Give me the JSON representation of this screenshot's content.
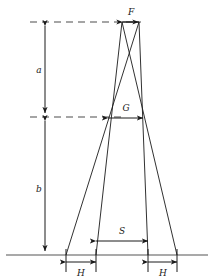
{
  "figure": {
    "background_color": "#ffffff",
    "line_color": "#1a1a1a",
    "ground_color": "#8c8c8c",
    "dashed_color": "#4d4d4d",
    "width": 214,
    "height": 280
  },
  "dimensions": {
    "a": {
      "label": "a",
      "orientation": "vertical",
      "description": "vertical distance from top dashed line to middle dashed line"
    },
    "b": {
      "label": "b",
      "orientation": "vertical",
      "description": "vertical distance from middle dashed line to ground line"
    },
    "F": {
      "label": "F",
      "orientation": "horizontal",
      "description": "width at top apex"
    },
    "G": {
      "label": "G",
      "orientation": "horizontal",
      "description": "width at middle dashed line"
    },
    "S": {
      "label": "S",
      "orientation": "horizontal",
      "description": "inner track spacing at ground level"
    },
    "H_left": {
      "label": "H",
      "orientation": "horizontal",
      "description": "left contact patch width at ground level"
    },
    "H_right": {
      "label": "H",
      "orientation": "horizontal",
      "description": "right contact patch width at ground level"
    }
  },
  "geometry": {
    "ground_y": 255,
    "top_dash_y": 22,
    "mid_dash_y": 117,
    "apex_left_x": 122,
    "apex_right_x": 139,
    "ground_points_x": [
      66,
      96,
      148,
      177
    ],
    "mid_left_x": 108,
    "mid_right_x": 143
  }
}
